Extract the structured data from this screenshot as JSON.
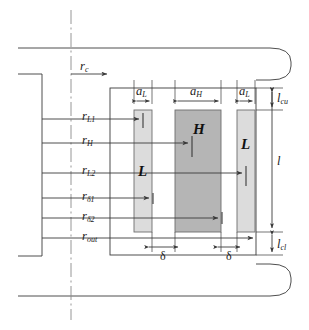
{
  "figure": {
    "type": "engineering-cross-section",
    "colors": {
      "line": "#3a3a3a",
      "bar_low_fill": "#dcdcdc",
      "bar_high_fill": "#b5b5b5",
      "bar_stroke": "#6e6e6e",
      "centerline": "#8a8a8a",
      "background": "#ffffff"
    }
  },
  "radius_labels": [
    {
      "name": "r-c",
      "base": "r",
      "sub": "c",
      "text": "rc",
      "y": 74,
      "arrow_to_x": 110
    },
    {
      "name": "r-L1",
      "base": "r",
      "sub": "L1",
      "text": "rL1",
      "y": 119,
      "arrow_to_x": 142
    },
    {
      "name": "r-H",
      "base": "r",
      "sub": "H",
      "text": "rH",
      "y": 143,
      "arrow_to_x": 191
    },
    {
      "name": "r-L2",
      "base": "r",
      "sub": "L2",
      "text": "rL2",
      "y": 173,
      "arrow_to_x": 245
    },
    {
      "name": "r-delta1",
      "base": "r",
      "sub": "δ1",
      "text": "rδ1",
      "y": 198,
      "arrow_to_x": 152
    },
    {
      "name": "r-delta2",
      "base": "r",
      "sub": "δ2",
      "text": "rδ2",
      "y": 218,
      "arrow_to_x": 221
    },
    {
      "name": "r-out",
      "base": "r",
      "sub": "out",
      "text": "rout",
      "y": 238,
      "arrow_to_x": 256
    }
  ],
  "width_labels": [
    {
      "name": "a-L-left",
      "base": "a",
      "sub": "L",
      "text": "aL",
      "x1": 134,
      "x2": 152
    },
    {
      "name": "a-H",
      "base": "a",
      "sub": "H",
      "text": "aH",
      "x1": 175,
      "x2": 221
    },
    {
      "name": "a-L-right",
      "base": "a",
      "sub": "L",
      "text": "aL",
      "x1": 237,
      "x2": 255
    }
  ],
  "length_labels": [
    {
      "name": "l-cu",
      "base": "l",
      "sub": "cu",
      "text": "lcu",
      "y1": 88,
      "y2": 110
    },
    {
      "name": "l",
      "base": "l",
      "sub": "",
      "text": "l",
      "y1": 88,
      "y2": 232
    },
    {
      "name": "l-cl",
      "base": "l",
      "sub": "cl",
      "text": "lcl",
      "y1": 232,
      "y2": 255
    }
  ],
  "gap_labels": [
    {
      "name": "delta-left",
      "text": "δ",
      "x1": 152,
      "x2": 175
    },
    {
      "name": "delta-right",
      "text": "δ",
      "x1": 221,
      "x2": 237
    }
  ],
  "bars": [
    {
      "name": "magnet-bar-low-left",
      "material": "L",
      "x": 134,
      "y": 110,
      "w": 18,
      "h": 122,
      "fill": "#dcdcdc",
      "label_x": 143,
      "label_y": 172
    },
    {
      "name": "magnet-bar-high",
      "material": "H",
      "x": 175,
      "y": 110,
      "w": 46,
      "h": 122,
      "fill": "#b5b5b5",
      "label_x": 198,
      "label_y": 131
    },
    {
      "name": "magnet-bar-low-right",
      "material": "L",
      "x": 237,
      "y": 110,
      "w": 18,
      "h": 122,
      "fill": "#dcdcdc",
      "label_x": 246,
      "label_y": 145
    }
  ],
  "geometry": {
    "centerline_x": 71,
    "inner_frame": {
      "x": 110,
      "y": 88,
      "w": 146,
      "h": 167
    },
    "outer_top_y": 48,
    "outer_bottom_y": 296,
    "outer_left_x": 18,
    "outer_right_x": 291,
    "shaft_bracket": {
      "x": 18,
      "y": 74,
      "w": 24,
      "h": 182
    }
  }
}
